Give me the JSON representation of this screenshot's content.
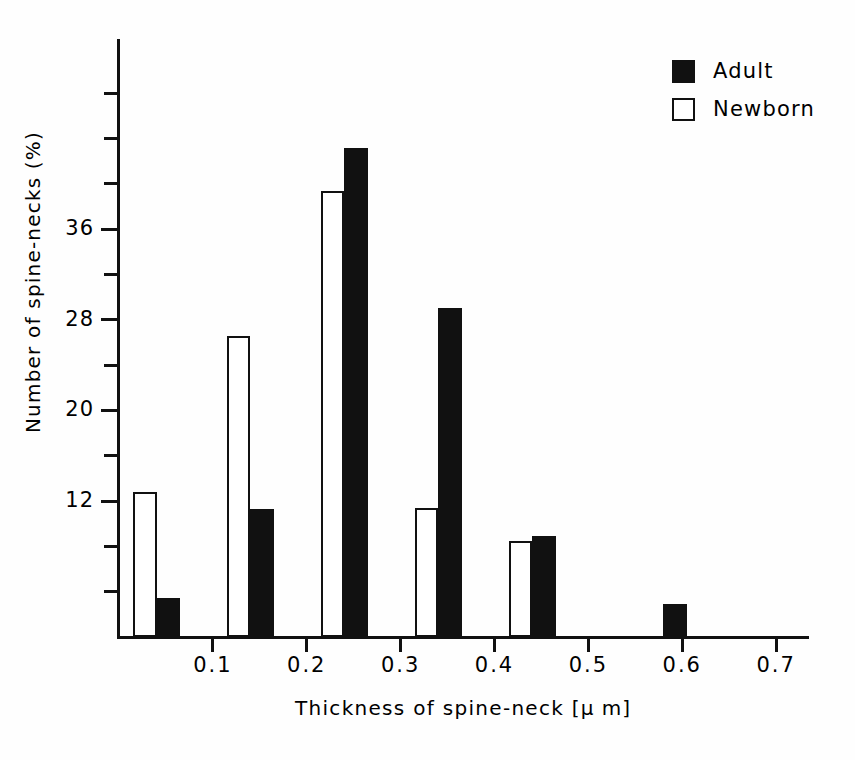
{
  "chart_data": {
    "type": "bar",
    "title": "",
    "subtitle": "",
    "xlabel": "Thickness of spine-neck [μ m]",
    "ylabel": "Number of spine-necks (%)",
    "xlabel_parts": {
      "text": "Thickness of spine-neck",
      "unit": "[μ m]"
    },
    "grid": false,
    "legend_position": "top-right",
    "xlim": [
      0.0,
      0.735
    ],
    "ylim": [
      0,
      53
    ],
    "xticks": [
      0.1,
      0.2,
      0.3,
      0.4,
      0.5,
      0.6,
      0.7
    ],
    "xtick_labels": [
      "0.1",
      "0.2",
      "0.3",
      "0.4",
      "0.5",
      "0.6",
      "0.7"
    ],
    "yticks": [
      4,
      8,
      12,
      16,
      20,
      24,
      28,
      32,
      36,
      40,
      44,
      48
    ],
    "ytick_labels_shown": [
      "12",
      "20",
      "28",
      "36"
    ],
    "ytick_major": [
      12,
      20,
      28,
      36
    ],
    "bin_width": 0.05,
    "categories": [
      "0.00-0.05",
      "0.10-0.15",
      "0.20-0.25",
      "0.30-0.35",
      "0.40-0.45",
      "0.55-0.60"
    ],
    "bin_starts": [
      0.015,
      0.115,
      0.215,
      0.315,
      0.415,
      0.555
    ],
    "series": [
      {
        "name": "Newborn",
        "color": "#ffffff",
        "edge_color": "#111111",
        "values": [
          12.8,
          26.6,
          39.4,
          11.4,
          8.5,
          0
        ]
      },
      {
        "name": "Adult",
        "color": "#111111",
        "edge_color": "#111111",
        "values": [
          3.4,
          11.3,
          43.2,
          29.0,
          8.9,
          2.9
        ]
      }
    ],
    "annotations": []
  },
  "legend": {
    "items": [
      {
        "label": "Adult",
        "swatch": "filled-square-icon",
        "fill": "#111111"
      },
      {
        "label": "Newborn",
        "swatch": "open-square-icon",
        "fill": "#ffffff"
      }
    ]
  },
  "colors": {
    "adult": "#111111",
    "newborn": "#ffffff",
    "axis": "#111111",
    "background": "#fefefe"
  }
}
